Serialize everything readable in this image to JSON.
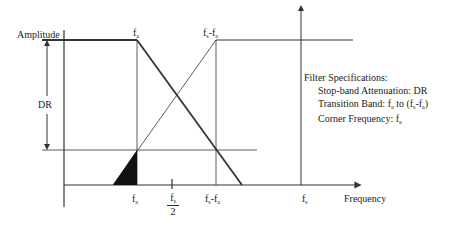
{
  "diagram": {
    "y_axis_label": "Amplitude",
    "x_axis_label": "Frequency",
    "dr_label": "DR",
    "top_labels": {
      "fa": {
        "base": "f",
        "sub": "a"
      },
      "fs_minus_fa": {
        "base": "f",
        "sub1": "s",
        "mid": "-f",
        "sub2": "a"
      }
    },
    "bottom_labels": {
      "fa": {
        "base": "f",
        "sub": "a"
      },
      "fs_half": {
        "num_base": "f",
        "num_sub": "s",
        "den": "2"
      },
      "fs_minus_fa": {
        "base": "f",
        "sub1": "s",
        "mid": "-f",
        "sub2": "a"
      },
      "fs": {
        "base": "f",
        "sub": "s"
      }
    },
    "specs": {
      "title": "Filter Specifications:",
      "line1_prefix": "Stop-band Attenuation: DR",
      "line2_prefix": "Transition Band: f",
      "line2_sub1": "a",
      "line2_mid": " to (f",
      "line2_sub2": "s",
      "line2_mid2": "-f",
      "line2_sub3": "a",
      "line2_end": ")",
      "line3_prefix": "Corner Frequency: f",
      "line3_sub": "a"
    },
    "colors": {
      "line": "#333333",
      "fill": "#111111",
      "background": "#ffffff"
    }
  }
}
